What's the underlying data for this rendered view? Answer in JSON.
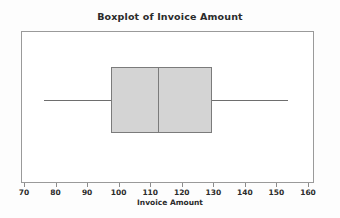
{
  "chart_data": {
    "type": "boxplot",
    "title": "Boxplot of Invoice Amount",
    "xlabel": "Invoice Amount",
    "ylabel": "",
    "orientation": "horizontal",
    "grid": false,
    "legend": null,
    "xlim": [
      70,
      160
    ],
    "xticks": [
      70,
      80,
      90,
      100,
      110,
      120,
      130,
      140,
      150,
      160
    ],
    "xtick_labels": [
      "70",
      "80",
      "90",
      "100",
      "110",
      "120",
      "130",
      "140",
      "150",
      "160"
    ],
    "boxes": [
      {
        "name": "Invoice Amount",
        "whisker_low": 76.3,
        "q1": 97.6,
        "median": 112.4,
        "q3": 129.6,
        "whisker_high": 153.6,
        "outliers": []
      }
    ],
    "colors": {
      "box_fill": "#d4d4d4",
      "box_edge": "#7b7b7b",
      "whisker": "#6e6e6e",
      "frame": "#9a9a9a",
      "text": "#2b2b2b",
      "background": "#fdfdfd",
      "plot_background": "#ffffff"
    }
  }
}
